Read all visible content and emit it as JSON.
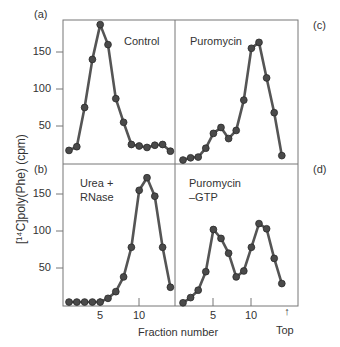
{
  "chart_data": [
    {
      "panel": "(a)",
      "type": "line",
      "annotation": "Control",
      "x": [
        1,
        2,
        3,
        4,
        5,
        6,
        7,
        8,
        9,
        10,
        11,
        12,
        13,
        14
      ],
      "values": [
        17,
        22,
        75,
        140,
        187,
        160,
        87,
        55,
        25,
        23,
        21,
        24,
        25,
        16
      ],
      "ylim": [
        0,
        190
      ],
      "yticks": [
        50,
        100,
        150
      ]
    },
    {
      "panel": "(c)",
      "type": "line",
      "annotation": "Puromycin",
      "x": [
        1,
        2,
        3,
        4,
        5,
        6,
        7,
        8,
        9,
        10,
        11,
        12,
        13,
        14
      ],
      "values": [
        4,
        7,
        8,
        20,
        40,
        48,
        33,
        44,
        85,
        155,
        163,
        115,
        68,
        10
      ],
      "ylim": [
        0,
        190
      ]
    },
    {
      "panel": "(b)",
      "type": "line",
      "annotation": "Urea + RNase",
      "x": [
        1,
        2,
        3,
        4,
        5,
        6,
        7,
        8,
        9,
        10,
        11,
        12,
        13,
        14
      ],
      "values": [
        4,
        4,
        4,
        4,
        4,
        9,
        18,
        38,
        78,
        155,
        172,
        147,
        78,
        24
      ],
      "ylim": [
        0,
        190
      ],
      "yticks": [
        50,
        100,
        150
      ],
      "xticks": [
        5,
        10
      ]
    },
    {
      "panel": "(d)",
      "type": "line",
      "annotation": "Puromycin –GTP",
      "x": [
        1,
        2,
        3,
        4,
        5,
        6,
        7,
        8,
        9,
        10,
        11,
        12,
        13,
        14
      ],
      "values": [
        3,
        10,
        20,
        45,
        102,
        90,
        70,
        38,
        46,
        78,
        110,
        103,
        63,
        29
      ],
      "ylim": [
        0,
        190
      ],
      "xticks": [
        5,
        10
      ]
    }
  ],
  "labels": {
    "panel_a": "(a)",
    "panel_b": "(b)",
    "panel_c": "(c)",
    "panel_d": "(d)",
    "cond_a": "Control",
    "cond_c": "Puromycin",
    "cond_b_1": "Urea +",
    "cond_b_2": "RNase",
    "cond_d_1": "Puromycin",
    "cond_d_2": "–GTP",
    "ylabel": "[¹⁴C]poly(Phe) (cpm)",
    "xlabel": "Fraction number",
    "top_label": "Top",
    "top_arrow": "↑",
    "y150": "150",
    "y100": "100",
    "y50": "50",
    "x5": "5",
    "x10": "10"
  }
}
